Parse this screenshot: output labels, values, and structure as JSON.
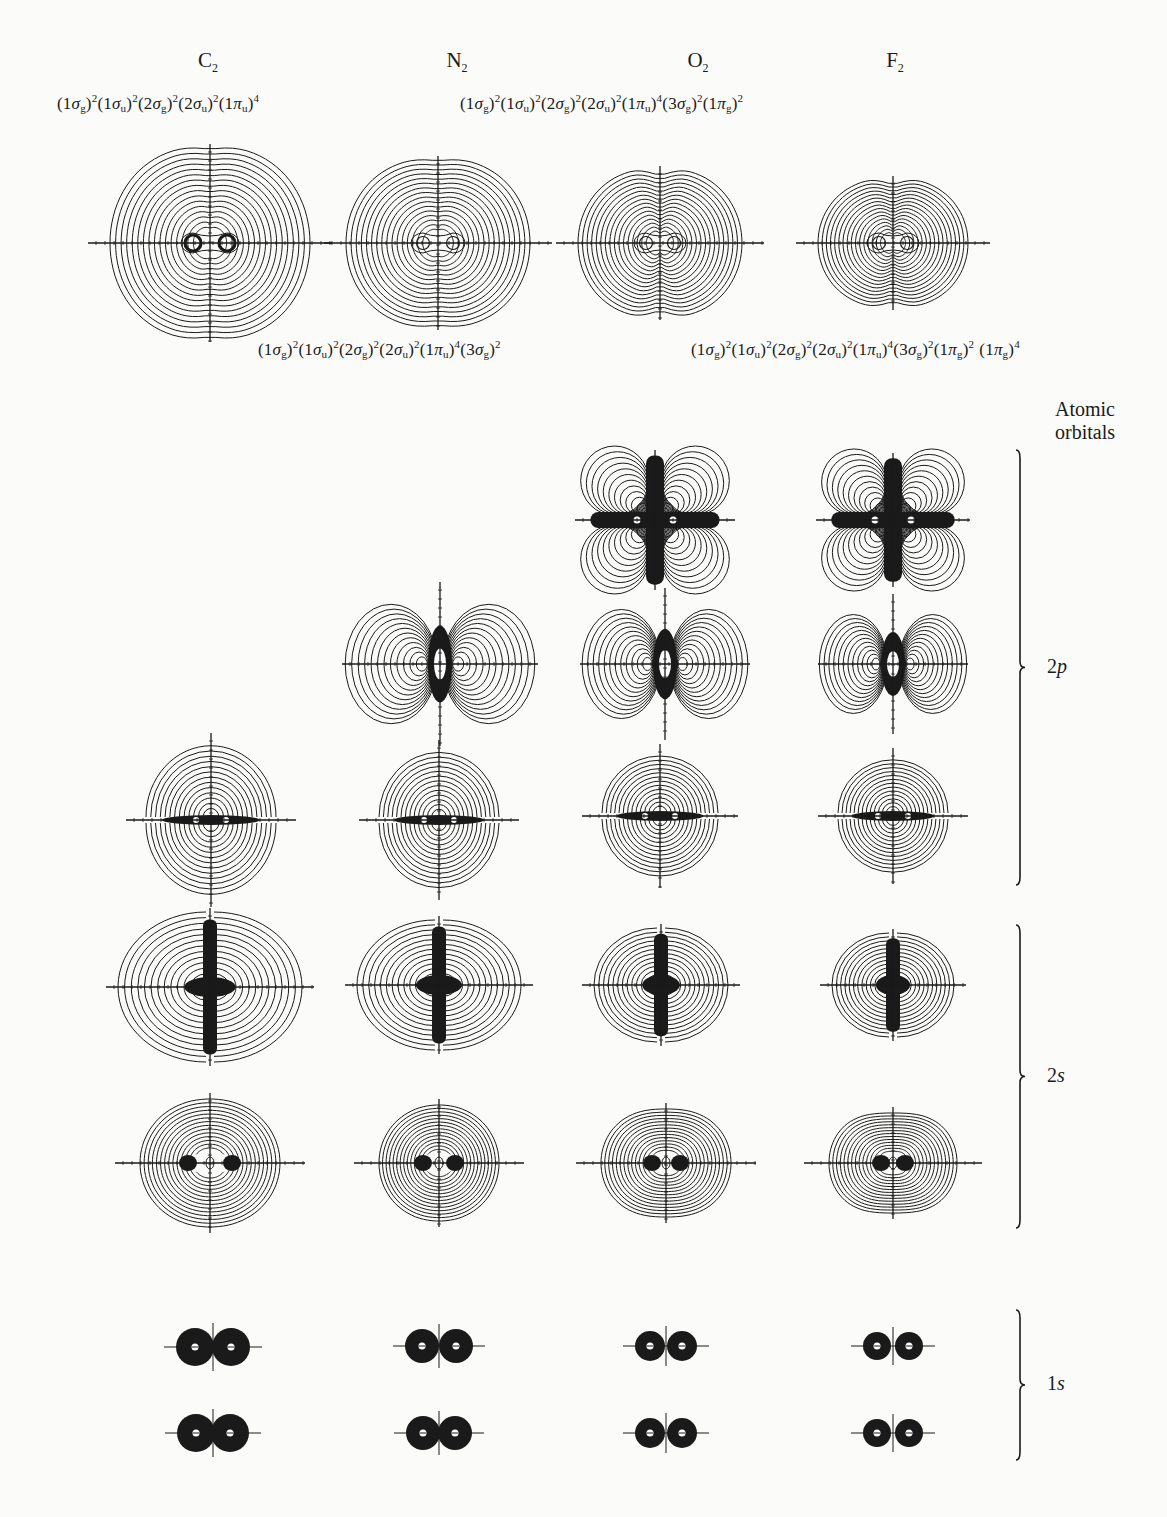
{
  "figure": {
    "molecules": [
      {
        "id": "C2",
        "symbol": "C",
        "subscript": "2",
        "x": 208
      },
      {
        "id": "N2",
        "symbol": "N",
        "subscript": "2",
        "x": 457
      },
      {
        "id": "O2",
        "symbol": "O",
        "subscript": "2",
        "x": 698
      },
      {
        "id": "F2",
        "symbol": "F",
        "subscript": "2",
        "x": 895
      }
    ],
    "configurations": [
      {
        "molecule": "C2",
        "position": "top-left",
        "text": "(1σg)²(1σu)²(2σg)²(2σu)²(1πu)⁴",
        "terms": [
          [
            "1",
            "σ",
            "g",
            "2"
          ],
          [
            "1",
            "σ",
            "u",
            "2"
          ],
          [
            "2",
            "σ",
            "g",
            "2"
          ],
          [
            "2",
            "σ",
            "u",
            "2"
          ],
          [
            "1",
            "π",
            "u",
            "4"
          ]
        ]
      },
      {
        "molecule": "O2",
        "position": "top-right",
        "text": "(1σg)²(1σu)²(2σg)²(2σu)²(1πu)⁴(3σg)²(1πg)²",
        "terms": [
          [
            "1",
            "σ",
            "g",
            "2"
          ],
          [
            "1",
            "σ",
            "u",
            "2"
          ],
          [
            "2",
            "σ",
            "g",
            "2"
          ],
          [
            "2",
            "σ",
            "u",
            "2"
          ],
          [
            "1",
            "π",
            "u",
            "4"
          ],
          [
            "3",
            "σ",
            "g",
            "2"
          ],
          [
            "1",
            "π",
            "g",
            "2"
          ]
        ]
      },
      {
        "molecule": "N2",
        "position": "bottom-left",
        "text": "(1σg)²(1σu)²(2σg)²(2σu)²(1πu)⁴(3σg)²",
        "terms": [
          [
            "1",
            "σ",
            "g",
            "2"
          ],
          [
            "1",
            "σ",
            "u",
            "2"
          ],
          [
            "2",
            "σ",
            "g",
            "2"
          ],
          [
            "2",
            "σ",
            "u",
            "2"
          ],
          [
            "1",
            "π",
            "u",
            "4"
          ],
          [
            "3",
            "σ",
            "g",
            "2"
          ]
        ]
      },
      {
        "molecule": "F2",
        "position": "bottom-right",
        "text": "(1σg)²(1σu)²(2σg)²(2σu)²(1πu)⁴(3σg)²(1πg)² (1πg)⁴",
        "terms": [
          [
            "1",
            "σ",
            "g",
            "2"
          ],
          [
            "1",
            "σ",
            "u",
            "2"
          ],
          [
            "2",
            "σ",
            "g",
            "2"
          ],
          [
            "2",
            "σ",
            "u",
            "2"
          ],
          [
            "1",
            "π",
            "u",
            "4"
          ],
          [
            "3",
            "σ",
            "g",
            "2"
          ],
          [
            "1",
            "π",
            "g",
            "2"
          ],
          [
            "1",
            "π",
            "g",
            "4"
          ]
        ]
      }
    ],
    "side_title": [
      "Atomic",
      "orbitals"
    ],
    "shells": [
      {
        "id": "2p",
        "num": "2",
        "letter": "p",
        "bracket_top": 450,
        "bracket_bottom": 885,
        "label_y": 650
      },
      {
        "id": "2s",
        "num": "2",
        "letter": "s",
        "bracket_top": 925,
        "bracket_bottom": 1228,
        "label_y": 1065
      },
      {
        "id": "1s",
        "num": "1",
        "letter": "s",
        "bracket_top": 1310,
        "bracket_bottom": 1460,
        "label_y": 1380
      }
    ],
    "total_density_row": [
      {
        "molecule": "C2",
        "cx": 210,
        "cy": 243,
        "rx": 100,
        "ry": 97,
        "type": "total",
        "sep": 17
      },
      {
        "molecule": "N2",
        "cx": 438,
        "cy": 243,
        "rx": 92,
        "ry": 85,
        "type": "total",
        "sep": 15
      },
      {
        "molecule": "O2",
        "cx": 660,
        "cy": 243,
        "rx": 82,
        "ry": 75,
        "type": "total",
        "sep": 14
      },
      {
        "molecule": "F2",
        "cx": 893,
        "cy": 243,
        "rx": 75,
        "ry": 65,
        "type": "total",
        "sep": 14
      }
    ],
    "orbital_plots": [
      {
        "row": "1pi_g",
        "molecule": "O2",
        "cx": 655,
        "cy": 520,
        "rx": 68,
        "ry": 68,
        "type": "pig"
      },
      {
        "row": "1pi_g",
        "molecule": "F2",
        "cx": 893,
        "cy": 520,
        "rx": 65,
        "ry": 65,
        "type": "pig"
      },
      {
        "row": "3sigma_g",
        "molecule": "N2",
        "cx": 440,
        "cy": 664,
        "rx": 88,
        "ry": 70,
        "type": "sigg3"
      },
      {
        "row": "3sigma_g",
        "molecule": "O2",
        "cx": 665,
        "cy": 664,
        "rx": 75,
        "ry": 64,
        "type": "sigg3"
      },
      {
        "row": "3sigma_g",
        "molecule": "F2",
        "cx": 893,
        "cy": 664,
        "rx": 65,
        "ry": 58,
        "type": "sigg3"
      },
      {
        "row": "1pi_u",
        "molecule": "C2",
        "cx": 211,
        "cy": 820,
        "rx": 65,
        "ry": 75,
        "type": "piu"
      },
      {
        "row": "1pi_u",
        "molecule": "N2",
        "cx": 439,
        "cy": 820,
        "rx": 60,
        "ry": 68,
        "type": "piu"
      },
      {
        "row": "1pi_u",
        "molecule": "O2",
        "cx": 660,
        "cy": 816,
        "rx": 58,
        "ry": 60,
        "type": "piu"
      },
      {
        "row": "1pi_u",
        "molecule": "F2",
        "cx": 893,
        "cy": 816,
        "rx": 55,
        "ry": 56,
        "type": "piu"
      },
      {
        "row": "2sigma_u",
        "molecule": "C2",
        "cx": 210,
        "cy": 987,
        "rx": 92,
        "ry": 75,
        "type": "sigu"
      },
      {
        "row": "2sigma_u",
        "molecule": "N2",
        "cx": 439,
        "cy": 985,
        "rx": 82,
        "ry": 65,
        "type": "sigu"
      },
      {
        "row": "2sigma_u",
        "molecule": "O2",
        "cx": 661,
        "cy": 985,
        "rx": 67,
        "ry": 57,
        "type": "sigu"
      },
      {
        "row": "2sigma_u",
        "molecule": "F2",
        "cx": 893,
        "cy": 985,
        "rx": 61,
        "ry": 52,
        "type": "sigu"
      },
      {
        "row": "2sigma_g",
        "molecule": "C2",
        "cx": 210,
        "cy": 1163,
        "rx": 70,
        "ry": 64,
        "type": "sigg2",
        "sep": 22
      },
      {
        "row": "2sigma_g",
        "molecule": "N2",
        "cx": 439,
        "cy": 1163,
        "rx": 60,
        "ry": 58,
        "type": "sigg2",
        "sep": 16
      },
      {
        "row": "2sigma_g",
        "molecule": "O2",
        "cx": 666,
        "cy": 1163,
        "rx": 65,
        "ry": 54,
        "type": "sigg2",
        "sep": 14
      },
      {
        "row": "2sigma_g",
        "molecule": "F2",
        "cx": 893,
        "cy": 1163,
        "rx": 64,
        "ry": 50,
        "type": "sigg2",
        "sep": 12
      },
      {
        "row": "1sigma_u",
        "molecule": "C2",
        "cx": 213,
        "cy": 1347,
        "r": 19,
        "sep": 18,
        "type": "core"
      },
      {
        "row": "1sigma_u",
        "molecule": "N2",
        "cx": 439,
        "cy": 1346,
        "r": 17,
        "sep": 17,
        "type": "core"
      },
      {
        "row": "1sigma_u",
        "molecule": "O2",
        "cx": 666,
        "cy": 1346,
        "r": 15,
        "sep": 16,
        "type": "core"
      },
      {
        "row": "1sigma_u",
        "molecule": "F2",
        "cx": 893,
        "cy": 1346,
        "r": 14,
        "sep": 16,
        "type": "core"
      },
      {
        "row": "1sigma_g",
        "molecule": "C2",
        "cx": 213,
        "cy": 1433,
        "r": 19,
        "sep": 17,
        "type": "core"
      },
      {
        "row": "1sigma_g",
        "molecule": "N2",
        "cx": 439,
        "cy": 1433,
        "r": 17,
        "sep": 16,
        "type": "core"
      },
      {
        "row": "1sigma_g",
        "molecule": "O2",
        "cx": 666,
        "cy": 1433,
        "r": 15,
        "sep": 16,
        "type": "core"
      },
      {
        "row": "1sigma_g",
        "molecule": "F2",
        "cx": 893,
        "cy": 1433,
        "r": 14,
        "sep": 16,
        "type": "core"
      }
    ],
    "colors": {
      "ink": "#1a1a1a",
      "paper": "#fbfbf9"
    }
  }
}
